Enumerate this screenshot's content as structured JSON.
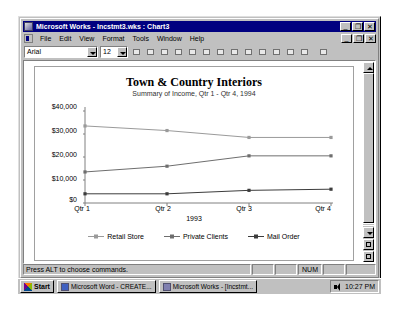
{
  "window": {
    "title": "Microsoft Works - Incstmt3.wks : Chart3",
    "icon": "works-app-icon",
    "buttons": {
      "minimize": "_",
      "maximize": "❐",
      "close": "✕"
    }
  },
  "menubar": {
    "items": [
      {
        "label": "File",
        "accel": "F"
      },
      {
        "label": "Edit",
        "accel": "E"
      },
      {
        "label": "View",
        "accel": "V"
      },
      {
        "label": "Format",
        "accel": "o"
      },
      {
        "label": "Tools",
        "accel": "T"
      },
      {
        "label": "Window",
        "accel": "W"
      },
      {
        "label": "Help",
        "accel": "H"
      }
    ],
    "doc_buttons": {
      "minimize": "_",
      "restore": "❐",
      "close": "✕"
    }
  },
  "toolbar": {
    "font_name": "Arial",
    "font_size": "12",
    "buttons": [
      "new-icon",
      "save-icon",
      "print-icon",
      "print-preview-icon",
      "copy-icon",
      "chart-icon",
      "insert-chart-icon",
      "spellcheck-icon",
      "clipboard-icon",
      "address-book-icon",
      "easy-calc-icon",
      "task-launcher-icon",
      "exit-icon",
      "help-icon"
    ]
  },
  "chart_data": {
    "type": "line",
    "title": "Town & Country Interiors",
    "subtitle": "Summary of Income, Qtr 1 - Qtr 4, 1994",
    "xlabel": "1993",
    "ylabel": "",
    "categories": [
      "Qtr 1",
      "Qtr 2",
      "Qtr 3",
      "Qtr 4"
    ],
    "ytick_labels": [
      "$0",
      "$10,000",
      "$20,000",
      "$30,000",
      "$40,000"
    ],
    "ytick_values": [
      0,
      10000,
      20000,
      30000,
      40000
    ],
    "ylim": [
      0,
      40000
    ],
    "grid": false,
    "legend_position": "bottom",
    "series": [
      {
        "name": "Retail Store",
        "values": [
          33500,
          31500,
          28500,
          28500
        ],
        "color": "#9a9a9a",
        "marker": "square"
      },
      {
        "name": "Private Clients",
        "values": [
          13500,
          16000,
          20500,
          20500
        ],
        "color": "#6e6e6e",
        "marker": "square"
      },
      {
        "name": "Mail Order",
        "values": [
          4000,
          4000,
          5500,
          6000
        ],
        "color": "#3c3c3c",
        "marker": "square"
      }
    ]
  },
  "scrollbar": {
    "up_arrow": "scroll-up-icon",
    "down_arrow": "scroll-down-icon",
    "extra1": "zoom-out-icon",
    "extra2": "zoom-in-icon"
  },
  "statusbar": {
    "message": "Press ALT to choose commands.",
    "num_indicator": "NUM"
  },
  "taskbar": {
    "start_label": "Start",
    "tasks": [
      {
        "label": "Microsoft Word - CREATE...",
        "icon": "word-icon"
      },
      {
        "label": "Microsoft Works - [Incstmt...",
        "icon": "works-icon"
      }
    ],
    "tray": {
      "volume_icon": "speaker-icon",
      "clock": "10:27 PM"
    }
  }
}
